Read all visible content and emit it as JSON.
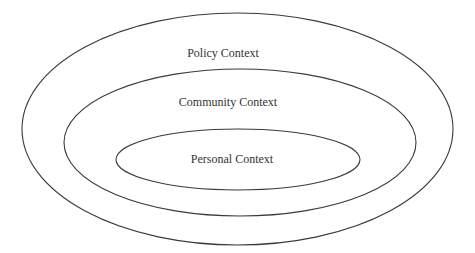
{
  "diagram": {
    "type": "nested-ellipses",
    "colors": {
      "stroke": "#3a3a3a",
      "text": "#333333",
      "background": "#ffffff"
    },
    "layers": [
      {
        "id": "policy",
        "label": "Policy Context",
        "level": "outer"
      },
      {
        "id": "community",
        "label": "Community Context",
        "level": "middle"
      },
      {
        "id": "personal",
        "label": "Personal Context",
        "level": "inner"
      }
    ]
  }
}
